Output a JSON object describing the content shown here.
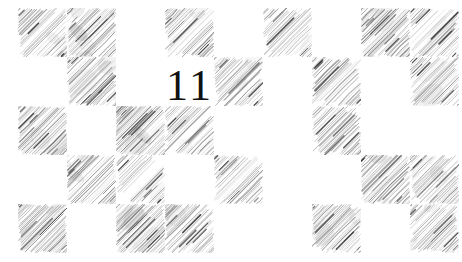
{
  "page": {
    "width": 462,
    "height": 262,
    "background_color": "#ffffff",
    "page_number": "11",
    "page_number_color": "#111111",
    "page_number_font_size_px": 44,
    "page_number_left_px": 166,
    "page_number_top_px": 64
  },
  "grid": {
    "columns": 9,
    "rows": 5,
    "cell_width_px": 49,
    "cell_height_px": 49,
    "origin_x_px": 18,
    "origin_y_px": 8,
    "hatch_color": "#2b2b2b",
    "hatch_angle_deg": 45,
    "hatch_direction": "lower-left-to-upper-right",
    "description": "hand-drawn pencil hatched checkerboard squares",
    "cells": [
      {
        "row": 0,
        "col": 0,
        "filled": true,
        "density": 0.8,
        "smudge": 0.25
      },
      {
        "row": 0,
        "col": 1,
        "filled": true,
        "density": 0.95,
        "smudge": 0.85
      },
      {
        "row": 0,
        "col": 2,
        "filled": false,
        "density": 0.0,
        "smudge": 0.0
      },
      {
        "row": 0,
        "col": 3,
        "filled": true,
        "density": 0.7,
        "smudge": 0.2
      },
      {
        "row": 0,
        "col": 4,
        "filled": false,
        "density": 0.0,
        "smudge": 0.0
      },
      {
        "row": 0,
        "col": 5,
        "filled": true,
        "density": 0.55,
        "smudge": 0.1
      },
      {
        "row": 0,
        "col": 6,
        "filled": false,
        "density": 0.0,
        "smudge": 0.0
      },
      {
        "row": 0,
        "col": 7,
        "filled": true,
        "density": 0.85,
        "smudge": 0.4
      },
      {
        "row": 0,
        "col": 8,
        "filled": true,
        "density": 0.78,
        "smudge": 0.3
      },
      {
        "row": 1,
        "col": 0,
        "filled": false,
        "density": 0.0,
        "smudge": 0.0
      },
      {
        "row": 1,
        "col": 1,
        "filled": true,
        "density": 0.82,
        "smudge": 0.45
      },
      {
        "row": 1,
        "col": 2,
        "filled": false,
        "density": 0.0,
        "smudge": 0.0
      },
      {
        "row": 1,
        "col": 3,
        "filled": false,
        "density": 0.0,
        "smudge": 0.0
      },
      {
        "row": 1,
        "col": 4,
        "filled": true,
        "density": 0.72,
        "smudge": 0.25
      },
      {
        "row": 1,
        "col": 5,
        "filled": false,
        "density": 0.0,
        "smudge": 0.0
      },
      {
        "row": 1,
        "col": 6,
        "filled": true,
        "density": 0.68,
        "smudge": 0.35
      },
      {
        "row": 1,
        "col": 7,
        "filled": false,
        "density": 0.0,
        "smudge": 0.0
      },
      {
        "row": 1,
        "col": 8,
        "filled": true,
        "density": 0.75,
        "smudge": 0.3
      },
      {
        "row": 2,
        "col": 0,
        "filled": true,
        "density": 0.88,
        "smudge": 0.5
      },
      {
        "row": 2,
        "col": 1,
        "filled": false,
        "density": 0.0,
        "smudge": 0.0
      },
      {
        "row": 2,
        "col": 2,
        "filled": true,
        "density": 0.92,
        "smudge": 0.75
      },
      {
        "row": 2,
        "col": 3,
        "filled": true,
        "density": 0.8,
        "smudge": 0.35
      },
      {
        "row": 2,
        "col": 4,
        "filled": false,
        "density": 0.0,
        "smudge": 0.0
      },
      {
        "row": 2,
        "col": 5,
        "filled": false,
        "density": 0.0,
        "smudge": 0.0
      },
      {
        "row": 2,
        "col": 6,
        "filled": true,
        "density": 0.62,
        "smudge": 0.2
      },
      {
        "row": 2,
        "col": 7,
        "filled": false,
        "density": 0.0,
        "smudge": 0.0
      },
      {
        "row": 2,
        "col": 8,
        "filled": false,
        "density": 0.0,
        "smudge": 0.0
      },
      {
        "row": 3,
        "col": 0,
        "filled": false,
        "density": 0.0,
        "smudge": 0.0
      },
      {
        "row": 3,
        "col": 1,
        "filled": true,
        "density": 0.9,
        "smudge": 0.6
      },
      {
        "row": 3,
        "col": 2,
        "filled": true,
        "density": 0.58,
        "smudge": 0.15
      },
      {
        "row": 3,
        "col": 3,
        "filled": false,
        "density": 0.0,
        "smudge": 0.0
      },
      {
        "row": 3,
        "col": 4,
        "filled": true,
        "density": 0.7,
        "smudge": 0.22
      },
      {
        "row": 3,
        "col": 5,
        "filled": false,
        "density": 0.0,
        "smudge": 0.0
      },
      {
        "row": 3,
        "col": 6,
        "filled": false,
        "density": 0.0,
        "smudge": 0.0
      },
      {
        "row": 3,
        "col": 7,
        "filled": true,
        "density": 0.86,
        "smudge": 0.55
      },
      {
        "row": 3,
        "col": 8,
        "filled": true,
        "density": 0.74,
        "smudge": 0.28
      },
      {
        "row": 4,
        "col": 0,
        "filled": true,
        "density": 0.84,
        "smudge": 0.45
      },
      {
        "row": 4,
        "col": 1,
        "filled": false,
        "density": 0.0,
        "smudge": 0.0
      },
      {
        "row": 4,
        "col": 2,
        "filled": true,
        "density": 0.93,
        "smudge": 0.8
      },
      {
        "row": 4,
        "col": 3,
        "filled": true,
        "density": 0.76,
        "smudge": 0.3
      },
      {
        "row": 4,
        "col": 4,
        "filled": false,
        "density": 0.0,
        "smudge": 0.0
      },
      {
        "row": 4,
        "col": 5,
        "filled": false,
        "density": 0.0,
        "smudge": 0.0
      },
      {
        "row": 4,
        "col": 6,
        "filled": true,
        "density": 0.66,
        "smudge": 0.25
      },
      {
        "row": 4,
        "col": 7,
        "filled": false,
        "density": 0.0,
        "smudge": 0.0
      },
      {
        "row": 4,
        "col": 8,
        "filled": true,
        "density": 0.71,
        "smudge": 0.32
      }
    ]
  }
}
